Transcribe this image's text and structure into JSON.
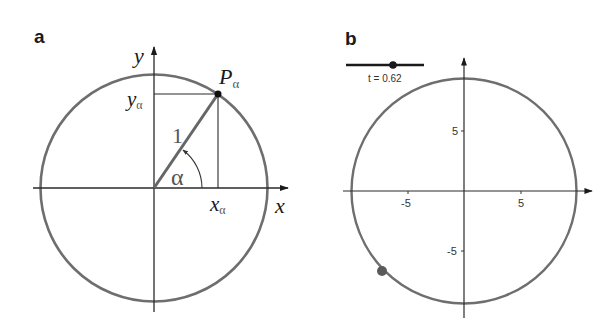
{
  "panels": [
    {
      "label": "a",
      "axis_labels": {
        "x": "x",
        "y": "y"
      },
      "point_label": "P",
      "point_subscript": "α",
      "x_proj_label": "x",
      "x_proj_subscript": "α",
      "y_proj_label": "y",
      "y_proj_subscript": "α",
      "radius_label": "1",
      "angle_label": "α"
    },
    {
      "label": "b",
      "slider": {
        "label": "t = 0.62",
        "value": 0.62
      },
      "x_ticks": [
        "-5",
        "5"
      ],
      "y_ticks": [
        "5",
        "-5"
      ]
    }
  ],
  "colors": {
    "circle": "#6e6e6e",
    "axis": "#2a2a2a",
    "radius": "#666666",
    "point_b": "#5a5a5a"
  }
}
